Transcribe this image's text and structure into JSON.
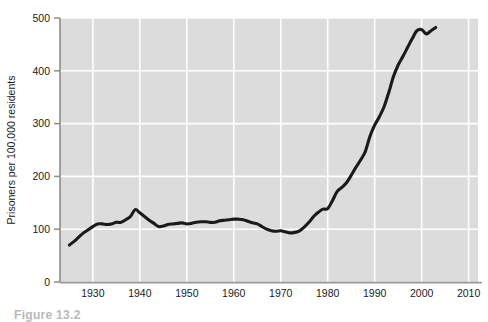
{
  "figure": {
    "caption": "Figure 13.2"
  },
  "chart_data": {
    "type": "line",
    "title": "",
    "xlabel": "",
    "ylabel": "Prisoners per 100,000 residents",
    "xlim": [
      1923,
      2012
    ],
    "ylim": [
      0,
      500
    ],
    "grid": true,
    "legend": null,
    "plot_background_color": "#dcdcdc",
    "gridline_color": "#ffffff",
    "line_color": "#1a1a1a",
    "axis_color": "#8c8c8c",
    "xticks": [
      1930,
      1940,
      1950,
      1960,
      1970,
      1980,
      1990,
      2000,
      2010
    ],
    "xtick_labels": [
      "1930",
      "1940",
      "1950",
      "1960",
      "1970",
      "1980",
      "1990",
      "2000",
      "2010"
    ],
    "yticks": [
      0,
      100,
      200,
      300,
      400,
      500
    ],
    "ytick_labels": [
      "0",
      "100",
      "200",
      "300",
      "400",
      "500"
    ],
    "series": [
      {
        "name": "Prisoners per 100,000 residents",
        "x": [
          1925,
          1926,
          1927,
          1928,
          1929,
          1930,
          1931,
          1932,
          1933,
          1934,
          1935,
          1936,
          1937,
          1938,
          1939,
          1940,
          1941,
          1942,
          1943,
          1944,
          1945,
          1946,
          1947,
          1948,
          1949,
          1950,
          1951,
          1952,
          1953,
          1954,
          1955,
          1956,
          1957,
          1958,
          1959,
          1960,
          1961,
          1962,
          1963,
          1964,
          1965,
          1966,
          1967,
          1968,
          1969,
          1970,
          1971,
          1972,
          1973,
          1974,
          1975,
          1976,
          1977,
          1978,
          1979,
          1980,
          1981,
          1982,
          1983,
          1984,
          1985,
          1986,
          1987,
          1988,
          1989,
          1990,
          1991,
          1992,
          1993,
          1994,
          1995,
          1996,
          1997,
          1998,
          1999,
          2000,
          2001,
          2002,
          2003
        ],
        "y": [
          70,
          77,
          85,
          93,
          99,
          105,
          110,
          110,
          109,
          110,
          113,
          113,
          118,
          124,
          137,
          131,
          124,
          117,
          111,
          105,
          106,
          109,
          110,
          111,
          112,
          110,
          111,
          113,
          114,
          114,
          113,
          113,
          116,
          117,
          118,
          119,
          119,
          118,
          115,
          112,
          110,
          105,
          100,
          97,
          96,
          97,
          95,
          93,
          94,
          97,
          104,
          113,
          124,
          132,
          138,
          139,
          154,
          171,
          179,
          188,
          202,
          217,
          231,
          247,
          276,
          297,
          313,
          332,
          359,
          389,
          411,
          427,
          444,
          461,
          476,
          478,
          470,
          476,
          482
        ]
      }
    ]
  }
}
